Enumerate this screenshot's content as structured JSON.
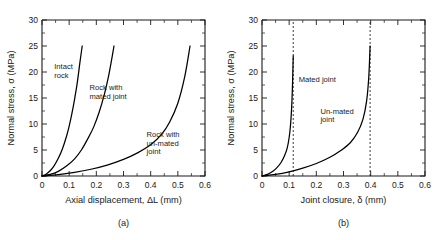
{
  "figure": {
    "panel_a_label": "(a)",
    "panel_b_label": "(b)"
  },
  "chart_data": [
    {
      "type": "line",
      "panel": "(a)",
      "title": "",
      "xlabel": "Axial displacement, ΔL (mm)",
      "ylabel": "Normal stress, σ (MPa)",
      "xlim": [
        0,
        0.6
      ],
      "ylim": [
        0,
        30
      ],
      "xticks": [
        0,
        0.1,
        0.2,
        0.3,
        0.4,
        0.5,
        0.6
      ],
      "xticklabels": [
        "0",
        "0.1",
        "0.2",
        "0.3",
        "0.4",
        "0.5",
        "0.6"
      ],
      "yticks": [
        0,
        5,
        10,
        15,
        20,
        25,
        30
      ],
      "yticklabels": [
        "0",
        "5",
        "10",
        "15",
        "20",
        "25",
        "30"
      ],
      "grid": false,
      "legend": "inline annotations",
      "annotations": [
        {
          "text": "Intact rock",
          "lines": [
            "Intact",
            "rock"
          ],
          "x": 0.045,
          "y": 20.5
        },
        {
          "text": "Rock with mated joint",
          "lines": [
            "Rock with",
            "mated joint"
          ],
          "x": 0.175,
          "y": 16.5
        },
        {
          "text": "Rock with un-mated joint",
          "lines": [
            "Rock with",
            "un-mated",
            "joint"
          ],
          "x": 0.385,
          "y": 7.5
        }
      ],
      "series": [
        {
          "name": "Intact rock",
          "x": [
            0,
            0.015,
            0.03,
            0.045,
            0.06,
            0.075,
            0.09,
            0.1,
            0.11,
            0.12,
            0.13,
            0.14,
            0.148
          ],
          "values": [
            0,
            0.35,
            1.0,
            2.0,
            3.4,
            5.2,
            7.6,
            9.6,
            12.0,
            14.8,
            18.0,
            22.0,
            25.0
          ]
        },
        {
          "name": "Rock with mated joint",
          "x": [
            0,
            0.03,
            0.06,
            0.09,
            0.12,
            0.145,
            0.17,
            0.19,
            0.21,
            0.23,
            0.245,
            0.255,
            0.265
          ],
          "values": [
            0,
            0.3,
            0.9,
            1.9,
            3.3,
            5.0,
            7.3,
            9.4,
            12.2,
            15.8,
            19.2,
            22.0,
            25.0
          ]
        },
        {
          "name": "Rock with un-mated joint",
          "x": [
            0,
            0.06,
            0.12,
            0.18,
            0.24,
            0.3,
            0.35,
            0.4,
            0.44,
            0.47,
            0.5,
            0.525,
            0.545
          ],
          "values": [
            0,
            0.25,
            0.7,
            1.3,
            2.1,
            3.2,
            4.4,
            6.0,
            8.0,
            10.4,
            14.0,
            19.0,
            25.0
          ]
        }
      ]
    },
    {
      "type": "line",
      "panel": "(b)",
      "title": "",
      "xlabel": "Joint closure, δ (mm)",
      "ylabel": "Normal stress, σ (MPa)",
      "xlim": [
        0,
        0.6
      ],
      "ylim": [
        0,
        30
      ],
      "xticks": [
        0,
        0.1,
        0.2,
        0.3,
        0.4,
        0.5,
        0.6
      ],
      "xticklabels": [
        "0",
        "0.1",
        "0.2",
        "0.3",
        "0.4",
        "0.5",
        "0.6"
      ],
      "yticks": [
        0,
        5,
        10,
        15,
        20,
        25,
        30
      ],
      "yticklabels": [
        "0",
        "5",
        "10",
        "15",
        "20",
        "25",
        "30"
      ],
      "grid": false,
      "legend": "inline annotations",
      "annotations": [
        {
          "text": "Mated joint",
          "lines": [
            "Mated joint"
          ],
          "x": 0.135,
          "y": 18.0
        },
        {
          "text": "Un-mated joint",
          "lines": [
            "Un-mated",
            "joint"
          ],
          "x": 0.215,
          "y": 12.0
        }
      ],
      "asymptotes": [
        {
          "label": "mated joint maximum closure",
          "x": 0.115
        },
        {
          "label": "un-mated joint maximum closure",
          "x": 0.398
        }
      ],
      "series": [
        {
          "name": "Mated joint",
          "x": [
            0,
            0.02,
            0.04,
            0.055,
            0.07,
            0.082,
            0.092,
            0.1,
            0.105,
            0.109,
            0.112,
            0.114,
            0.115
          ],
          "values": [
            0,
            0.3,
            0.9,
            1.6,
            2.6,
            3.8,
            5.2,
            7.4,
            9.8,
            13.0,
            17.0,
            21.0,
            23.1
          ]
        },
        {
          "name": "Un-mated joint",
          "x": [
            0,
            0.05,
            0.1,
            0.15,
            0.2,
            0.25,
            0.29,
            0.325,
            0.352,
            0.372,
            0.385,
            0.393,
            0.398
          ],
          "values": [
            0,
            0.3,
            0.8,
            1.5,
            2.4,
            3.6,
            4.9,
            6.4,
            8.4,
            11.0,
            14.4,
            19.0,
            25.0
          ]
        }
      ]
    }
  ]
}
